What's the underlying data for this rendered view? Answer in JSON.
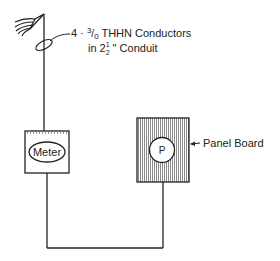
{
  "diagram": {
    "conductor_callout": {
      "line1_prefix": "4 · ",
      "line1_size_num": "3",
      "line1_size_den": "0",
      "line1_suffix": " THHN Conductors",
      "line2_prefix": "in 2",
      "line2_frac_num": "1",
      "line2_frac_den": "2",
      "line2_suffix": " \" Conduit"
    },
    "meter": {
      "label": "Meter"
    },
    "panel": {
      "symbol": "P",
      "label": "Panel Board"
    },
    "colors": {
      "line": "#222222",
      "hatch": "#555555",
      "background": "#ffffff"
    }
  }
}
